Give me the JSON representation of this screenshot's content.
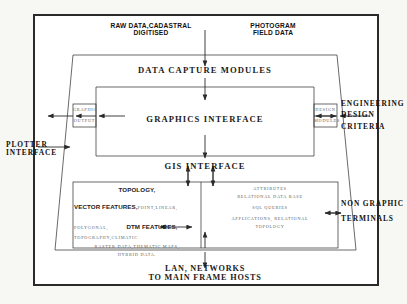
{
  "diagram": {
    "title_top_left": "RAW DATA,CADASTRAL",
    "title_top_left2": "DIGITISED",
    "title_top_right": "PHOTOGRAM",
    "title_top_right2": "FIELD DATA",
    "layers": {
      "data_capture": "DATA CAPTURE MODULES",
      "graphics_interface": "GRAPHICS INTERFACE",
      "gis_interface": "GIS INTERFACE"
    },
    "left_box": {
      "line1": "GRAPHIC",
      "line2": "OUTPUT"
    },
    "right_box": {
      "line1": "DESIGN",
      "line2": "MODULES"
    },
    "left_labels": {
      "plotter": "PLOTTER",
      "interface": "INTERFACE"
    },
    "right_labels": {
      "engineering": "ENGINEERING",
      "design": "DESIGN",
      "criteria": "CRITERIA",
      "non_graphic": "NON GRAPHIC",
      "terminals": "TERMINALS"
    },
    "vector_column": {
      "l1": "TOPOLOGY,",
      "l2a": "VECTOR FEATURES,",
      "l2b": "POINT,LINEAR,",
      "l3a": "POLYGONAL,",
      "l3b": "DTM FEATURES,",
      "l4": "TOPOGRAPHY,CLIMATIC",
      "l5": "RASTER DATA,THEMATIC MAPS,",
      "l6": "HYBRID DATA."
    },
    "attribute_column": {
      "l1": "ATTRIBUTES",
      "l2": "RELATIONAL   DATA  BASE",
      "l3": "SQL QUERIES",
      "l4": "APPLICATIONS, RELATIONAL",
      "l5": "TOPOLOGY"
    },
    "footer": {
      "l1": "LAN, NETWORKS",
      "l2": "TO MAIN FRAME HOSTS"
    }
  },
  "colors": {
    "ink": "#1a1a1a",
    "line": "#2a2a2a",
    "faint": "#5d5d5d",
    "page": "#f7f7f4",
    "panel": "#ffffff"
  }
}
